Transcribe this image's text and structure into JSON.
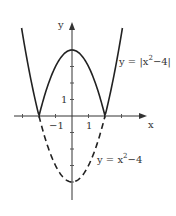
{
  "chart_data": {
    "type": "line",
    "title": "",
    "xlabel": "x",
    "ylabel": "y",
    "xlim": [
      -3.5,
      4.5
    ],
    "ylim": [
      -5,
      6
    ],
    "grid": false,
    "legend": "none",
    "x_ticks": [
      -3,
      -2,
      -1,
      0,
      1,
      2,
      3
    ],
    "x_tick_labels": [
      {
        "value": -1,
        "label": "-1"
      },
      {
        "value": 1,
        "label": "1"
      }
    ],
    "y_ticks": [
      -4,
      -3,
      -2,
      -1,
      0,
      1,
      2,
      3,
      4
    ],
    "y_tick_labels": [
      {
        "value": 1,
        "label": "1"
      }
    ],
    "series": [
      {
        "name": "y = |x^2-4|",
        "style": "solid",
        "x": [
          -3,
          -2.5,
          -2,
          -1.5,
          -1,
          -0.5,
          0,
          0.5,
          1,
          1.5,
          2,
          2.5,
          3
        ],
        "y": [
          5,
          2.25,
          0,
          1.75,
          3,
          3.75,
          4,
          3.75,
          3,
          1.75,
          0,
          2.25,
          5
        ]
      },
      {
        "name": "y = x^2-4",
        "style": "dashed",
        "x": [
          -2,
          -1.5,
          -1,
          -0.5,
          0,
          0.5,
          1,
          1.5,
          2
        ],
        "y": [
          0,
          -1.75,
          -3,
          -3.75,
          -4,
          -3.75,
          -3,
          -1.75,
          0
        ]
      }
    ],
    "annotations": [
      {
        "text": "y = |x^2-4|",
        "near": "right upper branch"
      },
      {
        "text": "y = x^2-4",
        "near": "right dashed branch"
      }
    ]
  },
  "labels": {
    "x_axis": "x",
    "y_axis": "y",
    "tick_neg1": "−1",
    "tick_pos1": "1",
    "tick_y1": "1",
    "abs_prefix": "y = |x",
    "abs_exp": "2",
    "abs_suffix": "−4|",
    "par_prefix": "y = x",
    "par_exp": "2",
    "par_suffix": "−4"
  }
}
